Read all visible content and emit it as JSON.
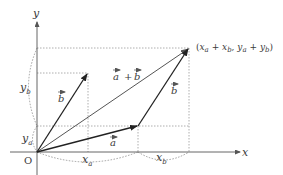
{
  "diagram": {
    "axes": {
      "x_label": "x",
      "y_label": "y",
      "origin_label": "O"
    },
    "vectors": {
      "a": {
        "label": "a",
        "components": [
          "x_a",
          "y_a"
        ]
      },
      "b": {
        "label": "b",
        "components": [
          "x_b",
          "y_b"
        ]
      },
      "sum": {
        "label_a": "a",
        "plus": "+",
        "label_b": "b"
      }
    },
    "component_labels": {
      "x_a": {
        "main": "x",
        "sub": "a"
      },
      "x_b": {
        "main": "x",
        "sub": "b"
      },
      "y_a": {
        "main": "y",
        "sub": "a"
      },
      "y_b": {
        "main": "y",
        "sub": "b"
      }
    },
    "endpoint_label": {
      "open": "(",
      "x": "x",
      "xa_sub": "a",
      "plus1": " + ",
      "x2": "x",
      "xb_sub": "b",
      "comma": ", ",
      "y": "y",
      "ya_sub": "a",
      "plus2": " + ",
      "y2": "y",
      "yb_sub": "b",
      "close": ")"
    },
    "colors": {
      "vector": "#222222",
      "sum_vector": "#555555",
      "axis": "#555555",
      "guide": "#888888"
    }
  }
}
